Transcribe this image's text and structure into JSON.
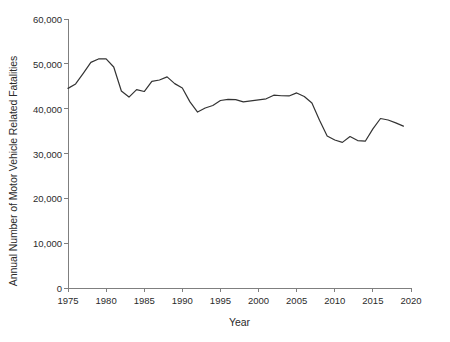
{
  "chart_data": {
    "type": "line",
    "title": "",
    "xlabel": "Year",
    "ylabel": "Annual Number of Motor Vehicle Related Fatalities",
    "xlim": [
      1975,
      2020
    ],
    "ylim": [
      0,
      60000
    ],
    "grid": false,
    "legend": "none",
    "line_color": "#333333",
    "x_ticks": [
      "1975",
      "1980",
      "1985",
      "1990",
      "1995",
      "2000",
      "2005",
      "2010",
      "2015",
      "2020"
    ],
    "y_ticks": [
      "0",
      "10,000",
      "20,000",
      "30,000",
      "40,000",
      "50,000",
      "60,000"
    ],
    "x_tick_values": [
      1975,
      1980,
      1985,
      1990,
      1995,
      2000,
      2005,
      2010,
      2015,
      2020
    ],
    "y_tick_values": [
      0,
      10000,
      20000,
      30000,
      40000,
      50000,
      60000
    ],
    "x": [
      1975,
      1976,
      1977,
      1978,
      1979,
      1980,
      1981,
      1982,
      1983,
      1984,
      1985,
      1986,
      1987,
      1988,
      1989,
      1990,
      1991,
      1992,
      1993,
      1994,
      1995,
      1996,
      1997,
      1998,
      1999,
      2000,
      2001,
      2002,
      2003,
      2004,
      2005,
      2006,
      2007,
      2008,
      2009,
      2010,
      2011,
      2012,
      2013,
      2014,
      2015,
      2016,
      2017,
      2018,
      2019
    ],
    "values": [
      44525,
      45523,
      47878,
      50331,
      51093,
      51091,
      49301,
      43945,
      42589,
      44257,
      43825,
      46087,
      46390,
      47087,
      45582,
      44599,
      41508,
      39250,
      40150,
      40716,
      41817,
      42065,
      42013,
      41501,
      41717,
      41945,
      42196,
      43005,
      42884,
      42836,
      43510,
      42708,
      41259,
      37423,
      33883,
      32999,
      32479,
      33782,
      32893,
      32744,
      35484,
      37806,
      37473,
      36835,
      36096
    ]
  }
}
